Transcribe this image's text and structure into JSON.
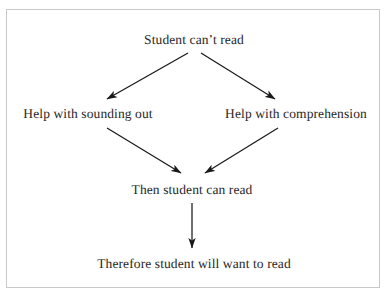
{
  "figure": {
    "type": "flow-diagram",
    "background_color": "#ffffff",
    "frame_color": "#c9c9c9",
    "text_color": "#282828",
    "arrow_color": "#1a1a1a"
  },
  "nodes": {
    "top": "Student can’t read",
    "left": "Help with sounding out",
    "right": "Help with comprehension",
    "middle": "Then student can read",
    "bottom": "Therefore student will want to read"
  },
  "arrows": [
    {
      "id": "top-to-left",
      "from": "top",
      "to": "left",
      "x1": 188,
      "y1": 53,
      "x2": 107,
      "y2": 99
    },
    {
      "id": "top-to-right",
      "from": "top",
      "to": "right",
      "x1": 201,
      "y1": 53,
      "x2": 275,
      "y2": 99
    },
    {
      "id": "left-to-middle",
      "from": "left",
      "to": "middle",
      "x1": 107,
      "y1": 128,
      "x2": 181,
      "y2": 173
    },
    {
      "id": "right-to-middle",
      "from": "right",
      "to": "middle",
      "x1": 278,
      "y1": 128,
      "x2": 205,
      "y2": 173
    },
    {
      "id": "middle-to-bottom",
      "from": "middle",
      "to": "bottom",
      "x1": 192,
      "y1": 203,
      "x2": 192,
      "y2": 248
    }
  ]
}
